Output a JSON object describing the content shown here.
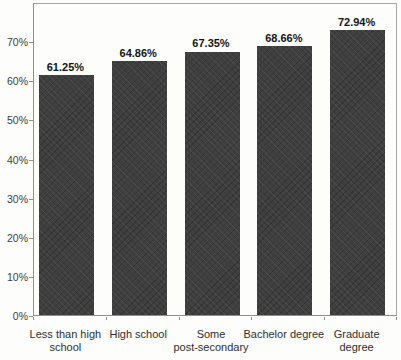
{
  "chart_data": {
    "type": "bar",
    "title": "",
    "xlabel": "",
    "ylabel": "",
    "categories": [
      "Less than high school",
      "High school",
      "Some post-secondary",
      "Bachelor degree",
      "Graduate degree"
    ],
    "category_labels_wrapped": [
      "Less than high\nschool",
      "High school",
      "Some\npost-secondary",
      "Bachelor degree",
      "Graduate\ndegree"
    ],
    "values": [
      61.25,
      64.86,
      67.35,
      68.66,
      72.94
    ],
    "value_labels": [
      "61.25%",
      "64.86%",
      "67.35%",
      "68.66%",
      "72.94%"
    ],
    "ylim": [
      0,
      80
    ],
    "yticks": [
      0,
      10,
      20,
      30,
      40,
      50,
      60,
      70
    ],
    "ytick_labels": [
      "0%",
      "10%",
      "20%",
      "30%",
      "40%",
      "50%",
      "60%",
      "70%"
    ],
    "grid": false,
    "legend": false,
    "bar_color": "#3e3e3e",
    "frame_color": "#a6a6a6"
  }
}
